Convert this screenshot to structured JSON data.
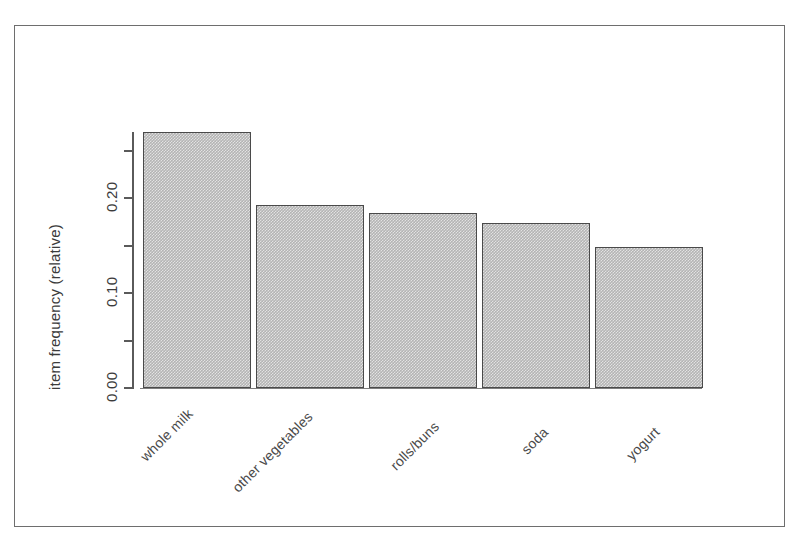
{
  "figure": {
    "frame_color": "#6e6e6e",
    "background": "#ffffff"
  },
  "axes": {
    "y_title": "item frequency (relative)",
    "y_ticks_labeled": [
      "0.00",
      "0.10",
      "0.20"
    ],
    "y_tick_values_labeled": [
      0.0,
      0.1,
      0.2
    ],
    "y_minor_tick_values": [
      0.05,
      0.15,
      0.25
    ],
    "x_categories": [
      "whole milk",
      "other vegetables",
      "rolls/buns",
      "soda",
      "yogurt"
    ],
    "axis_color": "#5a5a5a",
    "label_color": "#3b3b3b"
  },
  "chart_data": {
    "type": "bar",
    "title": "",
    "subtitle": "",
    "xlabel": "",
    "ylabel": "item frequency (relative)",
    "categories": [
      "whole milk",
      "other vegetables",
      "rolls/buns",
      "soda",
      "yogurt"
    ],
    "values": [
      0.27,
      0.193,
      0.184,
      0.174,
      0.148
    ],
    "ylim": [
      0.0,
      0.27
    ],
    "yticks": [
      0.0,
      0.05,
      0.1,
      0.15,
      0.2,
      0.25
    ],
    "ytick_labels": [
      "0.00",
      "",
      "0.10",
      "",
      "0.20",
      ""
    ],
    "grid": false,
    "legend": null,
    "legend_position": "none",
    "bar_fill": "#b4b4b4",
    "bar_border": "#4a4a4a",
    "orientation": "vertical",
    "xtick_label_rotation": -45,
    "ytick_label_rotation": -90
  }
}
